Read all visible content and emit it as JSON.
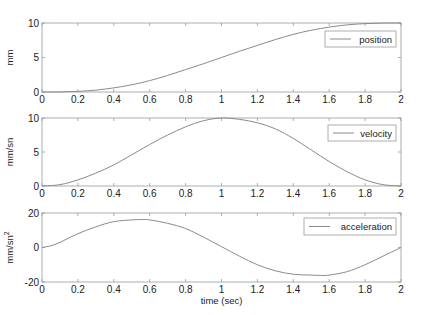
{
  "chart_data": [
    {
      "type": "line",
      "title": "",
      "xlabel": "",
      "ylabel": "mm",
      "xlim": [
        0,
        2
      ],
      "ylim": [
        0,
        10
      ],
      "xticks": [
        "0",
        "0.2",
        "0.4",
        "0.6",
        "0.8",
        "1",
        "1.2",
        "1.4",
        "1.6",
        "1.8",
        "2"
      ],
      "yticks": [
        "0",
        "5",
        "10"
      ],
      "grid": false,
      "legend_position": "upper right",
      "series": [
        {
          "name": "position",
          "x": [
            0,
            0.1,
            0.2,
            0.3,
            0.4,
            0.5,
            0.6,
            0.7,
            0.8,
            0.9,
            1.0,
            1.1,
            1.2,
            1.3,
            1.4,
            1.5,
            1.6,
            1.7,
            1.8,
            1.9,
            2.0
          ],
          "values": [
            0,
            0.01,
            0.09,
            0.27,
            0.6,
            1.05,
            1.65,
            2.4,
            3.25,
            4.1,
            5.0,
            5.9,
            6.75,
            7.6,
            8.35,
            8.95,
            9.4,
            9.73,
            9.91,
            9.99,
            10
          ]
        }
      ]
    },
    {
      "type": "line",
      "title": "",
      "xlabel": "",
      "ylabel": "mm/sn",
      "xlim": [
        0,
        2
      ],
      "ylim": [
        0,
        10
      ],
      "xticks": [
        "0",
        "0.2",
        "0.4",
        "0.6",
        "0.8",
        "1",
        "1.2",
        "1.4",
        "1.6",
        "1.8",
        "2"
      ],
      "yticks": [
        "0",
        "5",
        "10"
      ],
      "grid": false,
      "legend_position": "upper right",
      "series": [
        {
          "name": "velocity",
          "x": [
            0,
            0.1,
            0.2,
            0.3,
            0.4,
            0.5,
            0.6,
            0.7,
            0.8,
            0.9,
            1.0,
            1.1,
            1.2,
            1.3,
            1.4,
            1.5,
            1.6,
            1.7,
            1.8,
            1.9,
            2.0
          ],
          "values": [
            0,
            0.2,
            0.9,
            1.9,
            3.1,
            4.6,
            6.1,
            7.5,
            8.7,
            9.6,
            10,
            9.8,
            9.3,
            8.4,
            7.0,
            5.3,
            3.6,
            2.1,
            0.9,
            0.2,
            0
          ]
        }
      ]
    },
    {
      "type": "line",
      "title": "",
      "xlabel": "time (sec)",
      "ylabel": "mm/sn^2",
      "xlim": [
        0,
        2
      ],
      "ylim": [
        -20,
        20
      ],
      "xticks": [
        "0",
        "0.2",
        "0.4",
        "0.6",
        "0.8",
        "1",
        "1.2",
        "1.4",
        "1.6",
        "1.8",
        "2"
      ],
      "yticks": [
        "-20",
        "0",
        "20"
      ],
      "grid": false,
      "legend_position": "upper right",
      "series": [
        {
          "name": "acceleration",
          "x": [
            0,
            0.05,
            0.1,
            0.2,
            0.3,
            0.4,
            0.5,
            0.55,
            0.6,
            0.7,
            0.8,
            0.9,
            1.0,
            1.1,
            1.2,
            1.3,
            1.4,
            1.5,
            1.55,
            1.6,
            1.7,
            1.8,
            1.9,
            2.0
          ],
          "values": [
            0,
            1,
            3,
            8,
            12,
            15,
            16,
            16.2,
            16,
            14,
            11,
            6,
            0.5,
            -5,
            -10,
            -13.5,
            -15.5,
            -16,
            -16.2,
            -16,
            -14,
            -10,
            -5,
            0
          ]
        }
      ]
    }
  ],
  "figure": {
    "line_color": "#8a8a8a",
    "axes_color": "#9a9a9a",
    "text_color": "#222222"
  }
}
